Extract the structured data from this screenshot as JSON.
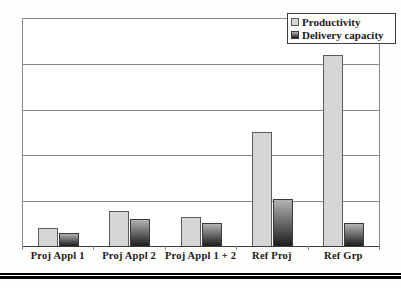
{
  "legend": {
    "items": [
      {
        "label": "Productivity",
        "swatch": "flat-light-gray"
      },
      {
        "label": "Delivery capacity",
        "swatch": "gradient-dark"
      }
    ]
  },
  "colors": {
    "productivity_fill": "#d6d6d6",
    "productivity_border": "#5a5a5a",
    "delivery_top": "#b2b2b2",
    "delivery_bottom": "#1c1c1c",
    "delivery_border": "#3a3a3a",
    "grid": "#8a8a8a",
    "axis": "#3c3c3c",
    "text": "#1a1a1a",
    "rule": "#000000"
  },
  "chart_data": {
    "type": "bar",
    "categories": [
      "Proj Appl 1",
      "Proj Appl 2",
      "Proj Appl 1 + 2",
      "Ref Proj",
      "Ref Grp"
    ],
    "series": [
      {
        "name": "Productivity",
        "values": [
          0.4,
          0.77,
          0.64,
          2.52,
          4.2
        ]
      },
      {
        "name": "Delivery capacity",
        "values": [
          0.28,
          0.59,
          0.5,
          1.03,
          0.5
        ]
      }
    ],
    "title": "",
    "xlabel": "",
    "ylabel": "",
    "ylim": [
      0,
      5
    ],
    "gridline_interval": 1,
    "y_tick_labels_visible": false,
    "legend_position": "top-right"
  }
}
